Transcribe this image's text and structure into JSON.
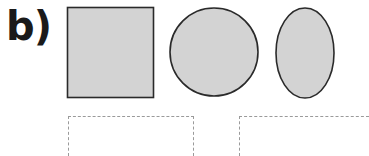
{
  "question": {
    "label": "b)",
    "shapes": [
      {
        "type": "square",
        "fill": "#d3d3d3",
        "stroke": "#2a2a2a"
      },
      {
        "type": "circle",
        "fill": "#d3d3d3",
        "stroke": "#2a2a2a"
      },
      {
        "type": "ellipse",
        "fill": "#d3d3d3",
        "stroke": "#2a2a2a"
      }
    ],
    "answer_boxes": [
      {
        "value": ""
      },
      {
        "value": ""
      }
    ]
  }
}
